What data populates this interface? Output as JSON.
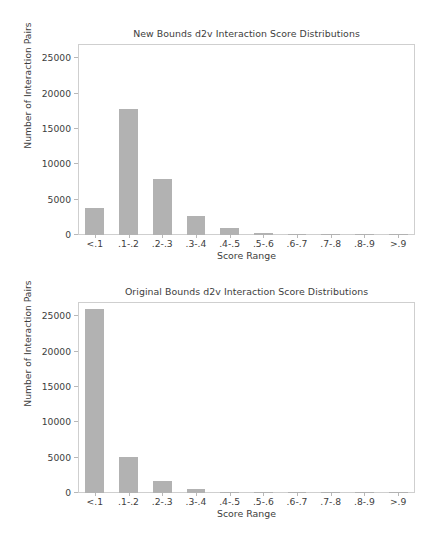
{
  "figure": {
    "width": 434,
    "height": 540,
    "background": "#ffffff",
    "bar_color": "#b2b2b2",
    "axis_color": "#cfcfcf",
    "text_color": "#3d3d3d"
  },
  "charts": [
    {
      "id": "new-bounds",
      "type": "bar",
      "title": "New Bounds d2v Interaction Score Distributions",
      "xlabel": "Score Range",
      "ylabel": "Number of Interaction Pairs",
      "categories": [
        "<.1",
        ".1-.2",
        ".2-.3",
        ".3-.4",
        ".4-.5",
        ".5-.6",
        ".6-.7",
        ".7-.8",
        ".8-.9",
        ">.9"
      ],
      "values": [
        3800,
        17800,
        7950,
        2650,
        950,
        350,
        120,
        60,
        30,
        20
      ],
      "ylim": [
        0,
        27000
      ],
      "yticks": [
        0,
        5000,
        10000,
        15000,
        20000,
        25000
      ],
      "ytick_labels": [
        "0",
        "5000",
        "10000",
        "15000",
        "20000",
        "25000"
      ],
      "grid": false,
      "legend": null
    },
    {
      "id": "original-bounds",
      "type": "bar",
      "title": "Original Bounds d2v Interaction Score Distributions",
      "xlabel": "Score Range",
      "ylabel": "Number of Interaction Pairs",
      "categories": [
        "<.1",
        ".1-.2",
        ".2-.3",
        ".3-.4",
        ".4-.5",
        ".5-.6",
        ".6-.7",
        ".7-.8",
        ".8-.9",
        ">.9"
      ],
      "values": [
        26000,
        5100,
        1700,
        500,
        160,
        70,
        40,
        25,
        15,
        10
      ],
      "ylim": [
        0,
        27000
      ],
      "yticks": [
        0,
        5000,
        10000,
        15000,
        20000,
        25000
      ],
      "ytick_labels": [
        "0",
        "5000",
        "10000",
        "15000",
        "20000",
        "25000"
      ],
      "grid": false,
      "legend": null
    }
  ],
  "chart_data": [
    {
      "type": "bar",
      "title": "New Bounds d2v Interaction Score Distributions",
      "xlabel": "Score Range",
      "ylabel": "Number of Interaction Pairs",
      "categories": [
        "<.1",
        ".1-.2",
        ".2-.3",
        ".3-.4",
        ".4-.5",
        ".5-.6",
        ".6-.7",
        ".7-.8",
        ".8-.9",
        ">.9"
      ],
      "values": [
        3800,
        17800,
        7950,
        2650,
        950,
        350,
        120,
        60,
        30,
        20
      ],
      "ylim": [
        0,
        27000
      ],
      "yticks": [
        0,
        5000,
        10000,
        15000,
        20000,
        25000
      ],
      "grid": false,
      "legend_position": "none"
    },
    {
      "type": "bar",
      "title": "Original Bounds d2v Interaction Score Distributions",
      "xlabel": "Score Range",
      "ylabel": "Number of Interaction Pairs",
      "categories": [
        "<.1",
        ".1-.2",
        ".2-.3",
        ".3-.4",
        ".4-.5",
        ".5-.6",
        ".6-.7",
        ".7-.8",
        ".8-.9",
        ">.9"
      ],
      "values": [
        26000,
        5100,
        1700,
        500,
        160,
        70,
        40,
        25,
        15,
        10
      ],
      "ylim": [
        0,
        27000
      ],
      "yticks": [
        0,
        5000,
        10000,
        15000,
        20000,
        25000
      ],
      "grid": false,
      "legend_position": "none"
    }
  ]
}
